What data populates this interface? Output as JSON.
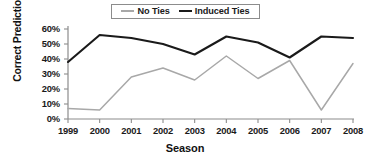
{
  "chart_data": {
    "type": "line",
    "title": "",
    "xlabel": "Season",
    "ylabel": "Correct Predictions",
    "categories": [
      "1999",
      "2000",
      "2001",
      "2002",
      "2003",
      "2004",
      "2005",
      "2006",
      "2007",
      "2008"
    ],
    "x": [
      1999,
      2000,
      2001,
      2002,
      2003,
      2004,
      2005,
      2006,
      2007,
      2008
    ],
    "series": [
      {
        "name": "No Ties",
        "color": "#a8a8a8",
        "values": [
          7,
          6,
          28,
          34,
          26,
          42,
          27,
          39,
          6,
          37
        ]
      },
      {
        "name": "Induced Ties",
        "color": "#1a1a1a",
        "values": [
          38,
          56,
          54,
          50,
          43,
          55,
          51,
          41,
          55,
          54
        ]
      }
    ],
    "ylim": [
      0,
      60
    ],
    "ytick_values": [
      0,
      10,
      20,
      30,
      40,
      50,
      60
    ],
    "ytick_labels": [
      "0%",
      "10%",
      "20%",
      "30%",
      "40%",
      "50%",
      "60%"
    ],
    "yunit": "%",
    "grid": false,
    "legend_position": "top-center",
    "legend_entries": [
      "No Ties",
      "Induced Ties"
    ]
  },
  "legend": {
    "entries": [
      {
        "label": "No Ties",
        "swatch": "line-swatch-gray"
      },
      {
        "label": "Induced Ties",
        "swatch": "line-swatch-black"
      }
    ]
  },
  "axes": {
    "y_title": "Correct Predictions",
    "x_title": "Season"
  }
}
